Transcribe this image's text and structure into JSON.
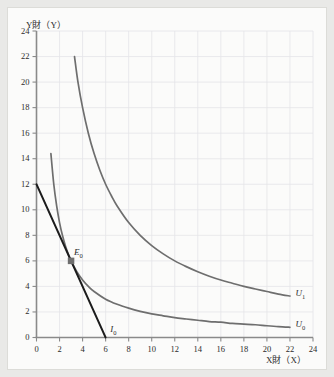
{
  "figure": {
    "background": "#fbfbfa",
    "page_background": "#e9e9e7"
  },
  "axes": {
    "y_title": "Y財（Y）",
    "x_title": "X財（X）",
    "x_ticks": [
      "0",
      "2",
      "4",
      "6",
      "8",
      "10",
      "12",
      "14",
      "16",
      "18",
      "20",
      "22",
      "24"
    ],
    "y_ticks": [
      "0",
      "2",
      "4",
      "6",
      "8",
      "10",
      "12",
      "14",
      "16",
      "18",
      "20",
      "22",
      "24"
    ],
    "axis_color": "#8a8a8a",
    "grid_color": "#e2e2e6"
  },
  "labels": {
    "u1": "U",
    "u1_sub": "1",
    "u0": "U",
    "u0_sub": "0",
    "i0": "I",
    "i0_sub": "0",
    "e0": "E",
    "e0_sub": "0"
  },
  "chart_data": {
    "type": "line",
    "title": "",
    "xlabel": "X財（X）",
    "ylabel": "Y財（Y）",
    "xlim": [
      0,
      24
    ],
    "ylim": [
      0,
      24
    ],
    "xticks": [
      0,
      2,
      4,
      6,
      8,
      10,
      12,
      14,
      16,
      18,
      20,
      22,
      24
    ],
    "yticks": [
      0,
      2,
      4,
      6,
      8,
      10,
      12,
      14,
      16,
      18,
      20,
      22,
      24
    ],
    "grid": true,
    "grid_spacing": 2,
    "legend": "inline-labels-at-curve-ends",
    "series": [
      {
        "name": "U0",
        "label": "U₀",
        "type": "indifference-curve",
        "color": "#6e6e6e",
        "equation": "x*y = 18",
        "points": [
          [
            1.25,
            14.4
          ],
          [
            1.5,
            12.0
          ],
          [
            1.75,
            10.3
          ],
          [
            2.0,
            9.0
          ],
          [
            2.25,
            8.0
          ],
          [
            2.5,
            7.2
          ],
          [
            2.75,
            6.55
          ],
          [
            3.0,
            6.0
          ],
          [
            3.5,
            5.15
          ],
          [
            4.0,
            4.5
          ],
          [
            4.5,
            4.0
          ],
          [
            5.0,
            3.6
          ],
          [
            6.0,
            3.0
          ],
          [
            7.0,
            2.6
          ],
          [
            8.0,
            2.3
          ],
          [
            9.0,
            2.05
          ],
          [
            10.0,
            1.85
          ],
          [
            11.0,
            1.7
          ],
          [
            12.0,
            1.55
          ],
          [
            13.0,
            1.45
          ],
          [
            14.0,
            1.35
          ],
          [
            15.0,
            1.25
          ],
          [
            16.0,
            1.2
          ],
          [
            17.0,
            1.1
          ],
          [
            18.0,
            1.05
          ],
          [
            19.0,
            1.0
          ],
          [
            20.0,
            0.92
          ],
          [
            21.0,
            0.85
          ],
          [
            22.0,
            0.8
          ]
        ],
        "label_position": [
          22.4,
          1.0
        ]
      },
      {
        "name": "U1",
        "label": "U₁",
        "type": "indifference-curve",
        "color": "#6e6e6e",
        "equation": "x*y = 72",
        "points": [
          [
            3.3,
            22.0
          ],
          [
            3.6,
            20.0
          ],
          [
            4.0,
            18.0
          ],
          [
            4.5,
            16.0
          ],
          [
            5.0,
            14.4
          ],
          [
            5.5,
            13.1
          ],
          [
            6.0,
            12.0
          ],
          [
            6.5,
            11.1
          ],
          [
            7.0,
            10.3
          ],
          [
            8.0,
            9.0
          ],
          [
            9.0,
            8.0
          ],
          [
            10.0,
            7.2
          ],
          [
            11.0,
            6.55
          ],
          [
            12.0,
            6.0
          ],
          [
            13.0,
            5.55
          ],
          [
            14.0,
            5.15
          ],
          [
            15.0,
            4.8
          ],
          [
            16.0,
            4.5
          ],
          [
            17.0,
            4.25
          ],
          [
            18.0,
            4.0
          ],
          [
            19.0,
            3.8
          ],
          [
            20.0,
            3.6
          ],
          [
            21.0,
            3.4
          ],
          [
            22.0,
            3.25
          ]
        ],
        "label_position": [
          22.4,
          3.4
        ]
      },
      {
        "name": "I0",
        "label": "I₀",
        "type": "budget-line",
        "color": "#1c1c1c",
        "equation": "y = 12 - 2x",
        "points": [
          [
            0,
            12
          ],
          [
            6,
            0
          ]
        ],
        "intercept_y": 12,
        "intercept_x": 6,
        "slope": -2,
        "label_position": [
          6.4,
          0.55
        ]
      }
    ],
    "annotations": [
      {
        "name": "E0",
        "label": "E₀",
        "type": "tangency-point",
        "x": 3,
        "y": 6,
        "marker": "filled-square",
        "color": "#6e6e6e"
      }
    ]
  }
}
